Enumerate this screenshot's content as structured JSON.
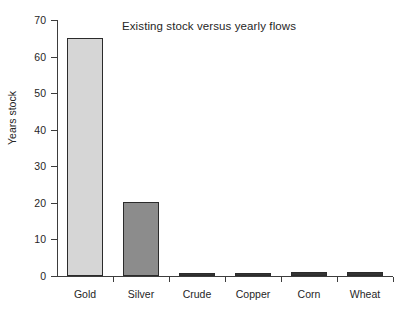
{
  "chart_data": {
    "type": "bar",
    "title": "Existing stock versus yearly flows",
    "xlabel": "",
    "ylabel": "Years stock",
    "categories": [
      "Gold",
      "Silver",
      "Crude",
      "Copper",
      "Corn",
      "Wheat"
    ],
    "values": [
      65,
      20.2,
      0.5,
      0.3,
      1.0,
      1.1
    ],
    "series": [
      {
        "name": "Years stock",
        "values": [
          65,
          20.2,
          0.5,
          0.3,
          1.0,
          1.1
        ]
      }
    ],
    "bar_colors": [
      "#d6d6d6",
      "#8c8c8c",
      "#333333",
      "#333333",
      "#333333",
      "#333333"
    ],
    "bar_border_color": "#2b2b2b",
    "ylim": [
      0,
      70
    ],
    "yticks": [
      0,
      10,
      20,
      30,
      40,
      50,
      60,
      70
    ],
    "ytick_labels": [
      "0",
      "10",
      "20",
      "30",
      "40",
      "50",
      "60",
      "70"
    ],
    "grid": false,
    "legend": null,
    "legend_position": "none",
    "axis_color": "#3d3d3d",
    "background_color": "#ffffff",
    "text_color": "#262626"
  }
}
